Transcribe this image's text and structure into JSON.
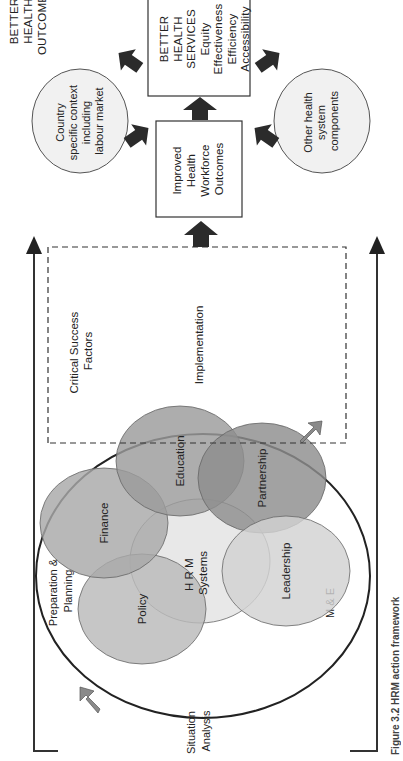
{
  "diagram": {
    "caption": "Figure 3.2  HRM action framework",
    "stages": {
      "situation_analysis": [
        "Situation",
        "Analysis"
      ],
      "preparation_planning": [
        "Preparation &",
        "Planning"
      ],
      "implementation": "Implementation",
      "monitoring_evaluation": "M & E"
    },
    "critical_success_factors": [
      "Critical Success",
      "Factors"
    ],
    "hrm_core": [
      "H R M",
      "Systems"
    ],
    "hrm_components": [
      {
        "label": "Policy",
        "color": "#b9b9b9"
      },
      {
        "label": "Finance",
        "color": "#a8a8a8"
      },
      {
        "label": "Education",
        "color": "#9b9b9b"
      },
      {
        "label": "Partnership",
        "color": "#8e8e8e"
      },
      {
        "label": "Leadership",
        "color": "#d2d2d2"
      }
    ],
    "outcome_boxes": {
      "workforce": [
        "Improved",
        "Health",
        "Workforce",
        "Outcomes"
      ],
      "services": [
        "BETTER",
        "HEALTH",
        "SERVICES",
        "Equity",
        "Effectiveness",
        "Efficiency",
        "Accessibility"
      ]
    },
    "context_circles": {
      "country": [
        "Country",
        "specific context",
        "including",
        "labour market"
      ],
      "other": [
        "Other health",
        "system",
        "components"
      ]
    },
    "final_outcome": [
      "BETTER",
      "HEALTH",
      "OUTCOMES"
    ],
    "colors": {
      "arrow": "#2b2b2b",
      "outline": "#333333",
      "cycle_arrow": "#8a8a8a",
      "context_fill": "#f1f1f1"
    }
  }
}
